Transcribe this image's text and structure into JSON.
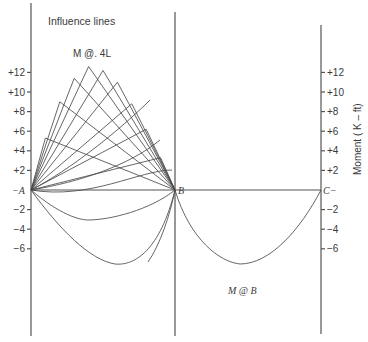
{
  "title": "Influence lines",
  "peak_label": "M @. 4L",
  "support_label": "M @ B",
  "y_axis_title": "Moment ( K – ft)",
  "points": {
    "A": "A",
    "B": "B",
    "C": "C"
  },
  "left_ticks": [
    "+12",
    "+10",
    "+8",
    "+6",
    "+4",
    "+2",
    "",
    "−2",
    "−4",
    "−6"
  ],
  "right_ticks": [
    "+12",
    "+10",
    "+8",
    "+6",
    "+4",
    "+2",
    "",
    "−2",
    "−4",
    "−6"
  ],
  "chart_data": {
    "type": "line",
    "title": "Influence lines",
    "ylabel": "Moment (K-ft)",
    "ylim": [
      -8,
      14
    ],
    "supports": [
      "A",
      "B",
      "C"
    ],
    "tick_values": [
      12,
      10,
      8,
      6,
      4,
      2,
      0,
      -2,
      -4,
      -6
    ],
    "span_AB_influence_peaks": [
      {
        "location": "0.1L",
        "peak": 5.3
      },
      {
        "location": "0.2L",
        "peak": 9.0
      },
      {
        "location": "0.3L",
        "peak": 11.4
      },
      {
        "location": "0.4L",
        "peak": 12.6,
        "label": "M @. 4L"
      },
      {
        "location": "0.5L",
        "peak": 12.2
      },
      {
        "location": "0.6L",
        "peak": 11.0
      },
      {
        "location": "0.7L",
        "peak": 8.8
      },
      {
        "location": "0.8L",
        "peak": 6.2
      },
      {
        "location": "0.9L",
        "peak": 3.3
      }
    ],
    "negative_curves": [
      {
        "name": "curve-1",
        "span": "A-B",
        "min": -2.3
      },
      {
        "name": "curve-2",
        "span": "A-B",
        "min": -6.0
      },
      {
        "name": "M @ B",
        "span": "B-C",
        "min": -6.0
      }
    ]
  }
}
